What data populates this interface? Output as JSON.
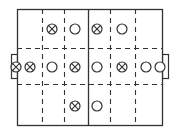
{
  "diagram": {
    "type": "soccer-field-formation",
    "field": {
      "x1": 17,
      "y1": 9,
      "x2": 162,
      "y2": 125,
      "stroke": "#333333"
    },
    "center_line_x": 88,
    "dashed_vertical_x": [
      42,
      64,
      110,
      135
    ],
    "dashed_horizontal_y": [
      48,
      84
    ],
    "goals": {
      "left": {
        "x": 11,
        "y": 54,
        "w": 6,
        "h": 24
      },
      "right": {
        "x": 162,
        "y": 54,
        "w": 6,
        "h": 24
      }
    },
    "marker_radius": 5,
    "legend_semantics": {
      "crossed_circle": "team-a-player",
      "open_circle": "team-b-player"
    },
    "players": [
      {
        "type": "crossed",
        "x": 52,
        "y": 29
      },
      {
        "type": "open",
        "x": 75,
        "y": 29
      },
      {
        "type": "crossed",
        "x": 97,
        "y": 29
      },
      {
        "type": "open",
        "x": 122,
        "y": 29
      },
      {
        "type": "crossed",
        "x": 16,
        "y": 67
      },
      {
        "type": "crossed",
        "x": 30,
        "y": 67
      },
      {
        "type": "open",
        "x": 52,
        "y": 67
      },
      {
        "type": "crossed",
        "x": 75,
        "y": 67
      },
      {
        "type": "open",
        "x": 97,
        "y": 67
      },
      {
        "type": "crossed",
        "x": 122,
        "y": 67
      },
      {
        "type": "open",
        "x": 146,
        "y": 67
      },
      {
        "type": "open",
        "x": 160,
        "y": 67
      },
      {
        "type": "crossed",
        "x": 75,
        "y": 106
      },
      {
        "type": "open",
        "x": 97,
        "y": 106
      }
    ]
  }
}
